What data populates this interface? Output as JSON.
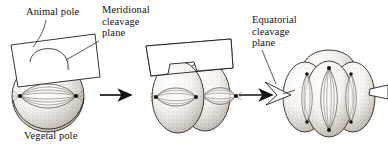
{
  "figure": {
    "background_color": "#ffffff",
    "ink_color": "#16120f",
    "stipple_color": "#8d8076",
    "cell_fill": "#f4f1ec",
    "plane_fill": "#ffffff"
  },
  "labels": {
    "animal_pole": "Animal pole",
    "vegetal_pole": "Vegetal pole",
    "meridional_plane": "Meridional\ncleavage\nplane",
    "equatorial_plane": "Equatorial\ncleavage\nplane"
  },
  "stages": [
    {
      "id": "stage-1",
      "name": "one-cell-zygote",
      "cell_count": 1,
      "spindle_orientation": "horizontal",
      "spindle_count": 1,
      "centrosome_dots": 2,
      "plane": "meridional",
      "plane_orientation": "vertical-sheet-tilted"
    },
    {
      "id": "stage-2",
      "name": "two-cell-embryo",
      "cell_count": 2,
      "spindle_orientation": "horizontal",
      "spindle_count": 2,
      "centrosome_dots": 3,
      "plane": "meridional",
      "plane_orientation": "vertical-sheet-tilted"
    },
    {
      "id": "stage-3",
      "name": "four-cell-embryo",
      "cell_count": 4,
      "spindle_orientation": "vertical",
      "spindle_count": 3,
      "centrosome_dots": 6,
      "plane": "equatorial",
      "plane_orientation": "horizontal-sheet"
    }
  ],
  "arrows": [
    {
      "id": "arrow-1",
      "from": "stage-1",
      "to": "stage-2",
      "direction": "right"
    },
    {
      "id": "arrow-2",
      "from": "stage-2",
      "to": "stage-3",
      "direction": "right"
    }
  ],
  "leader_lines": [
    {
      "id": "leader-animal-pole",
      "label": "animal_pole",
      "target": "stage-1-animal-pole"
    },
    {
      "id": "leader-meridional",
      "label": "meridional_plane",
      "target": "stage-1-cleavage-plane"
    },
    {
      "id": "leader-equatorial",
      "label": "equatorial_plane",
      "target": "stage-3-cleavage-plane"
    }
  ]
}
